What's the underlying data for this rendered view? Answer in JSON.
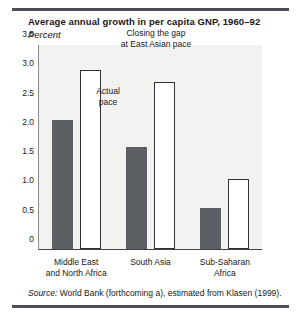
{
  "chart_data": {
    "type": "bar",
    "title": "Average annual growth in per capita GNP, 1960–92",
    "subtitle": "Percent",
    "xlabel": "",
    "ylabel": "Percent",
    "ylim": [
      0,
      3.5
    ],
    "yticks": [
      "0",
      "0.5",
      "1.0",
      "1.5",
      "2.0",
      "2.5",
      "3.0",
      "3.5"
    ],
    "ytick_values": [
      0,
      0.5,
      1.0,
      1.5,
      2.0,
      2.5,
      3.0,
      3.5
    ],
    "grid": false,
    "legend_position": "inline-annotations",
    "categories": [
      "Middle East and North Africa",
      "South Asia",
      "Sub-Saharan Africa"
    ],
    "category_lines": [
      [
        "Middle East",
        "and North Africa"
      ],
      [
        "South Asia"
      ],
      [
        "Sub-Saharan",
        "Africa"
      ]
    ],
    "series": [
      {
        "name": "Actual pace",
        "color": "#5b5f63",
        "values": [
          2.2,
          1.75,
          0.7
        ]
      },
      {
        "name": "Closing the gap at East Asian pace",
        "color": "#ffffff",
        "values": [
          3.05,
          2.85,
          1.2
        ]
      }
    ],
    "annotations": [
      {
        "id": "closing",
        "lines": [
          "Closing the gap",
          "at East Asian pace"
        ]
      },
      {
        "id": "actual",
        "lines": [
          "Actual",
          "pace"
        ]
      }
    ]
  },
  "source": {
    "label": "Source:",
    "text": " World Bank (forthcoming a), estimated from Klasen (1999)."
  }
}
